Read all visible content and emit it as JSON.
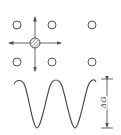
{
  "diagram": {
    "lattice": {
      "empty_sites": [
        {
          "x": 17,
          "y": 25
        },
        {
          "x": 52,
          "y": 25
        },
        {
          "x": 92,
          "y": 25
        },
        {
          "x": 17,
          "y": 62
        },
        {
          "x": 52,
          "y": 62
        },
        {
          "x": 92,
          "y": 62
        }
      ],
      "atom": {
        "x": 35,
        "y": 43,
        "fill": "hatched"
      },
      "jump_directions": [
        "up",
        "down",
        "left",
        "right"
      ]
    },
    "energy_profile": {
      "label": "ΔG",
      "peaks": 3,
      "troughs": 2
    },
    "colors": {
      "stroke": "#555555",
      "background": "#ffffff"
    }
  }
}
